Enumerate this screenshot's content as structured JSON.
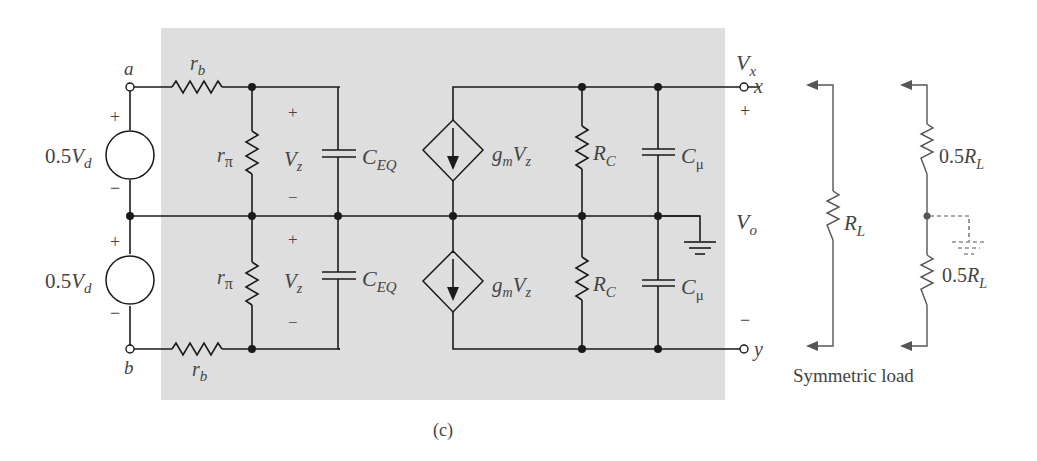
{
  "figure": {
    "caption": "(c)",
    "background_color": "#ffffff",
    "panel_color": "#dedede",
    "wire_color": "#1a1a1a",
    "label_color": "#444444"
  },
  "terminals": {
    "a": "a",
    "b": "b",
    "x": "x",
    "y": "y"
  },
  "sources": {
    "top": {
      "coef": "0.5",
      "var": "V",
      "sub": "d",
      "plus": "+",
      "minus": "−"
    },
    "bottom": {
      "coef": "0.5",
      "var": "V",
      "sub": "d",
      "plus": "+",
      "minus": "−"
    }
  },
  "components": {
    "rb_top": {
      "base": "r",
      "sub": "b"
    },
    "rb_bottom": {
      "base": "r",
      "sub": "b"
    },
    "rpi_top": {
      "base": "r",
      "sub": "π"
    },
    "rpi_bottom": {
      "base": "r",
      "sub": "π"
    },
    "vz_top": {
      "base": "V",
      "sub": "z",
      "plus": "+",
      "minus": "−"
    },
    "vz_bottom": {
      "base": "V",
      "sub": "z",
      "plus": "+",
      "minus": "−"
    },
    "ceq_top": {
      "base": "C",
      "sub": "EQ"
    },
    "ceq_bottom": {
      "base": "C",
      "sub": "EQ"
    },
    "gm_top": {
      "g": "g",
      "m": "m",
      "V": "V",
      "z": "z"
    },
    "gm_bottom": {
      "g": "g",
      "m": "m",
      "V": "V",
      "z": "z"
    },
    "rc_top": {
      "base": "R",
      "sub": "C"
    },
    "rc_bottom": {
      "base": "R",
      "sub": "C"
    },
    "cmu_top": {
      "base": "C",
      "sub": "μ"
    },
    "cmu_bottom": {
      "base": "C",
      "sub": "μ"
    }
  },
  "outputs": {
    "vx": {
      "base": "V",
      "sub": "x"
    },
    "vo": {
      "base": "V",
      "sub": "o"
    },
    "plus": "+",
    "minus": "−"
  },
  "load": {
    "rl": {
      "base": "R",
      "sub": "L"
    },
    "half_top": {
      "coef": "0.5",
      "base": "R",
      "sub": "L"
    },
    "half_bottom": {
      "coef": "0.5",
      "base": "R",
      "sub": "L"
    },
    "label": "Symmetric load"
  }
}
